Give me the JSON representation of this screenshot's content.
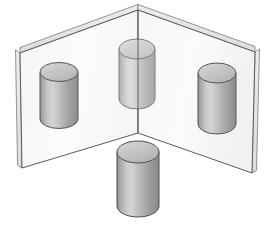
{
  "figure": {
    "canvas": {
      "width": 266,
      "height": 225,
      "background": "#ffffff"
    },
    "palette": {
      "plane_fill": "#fbfbfb",
      "plane_fill_right": "#f7f7f7",
      "plane_edge": "#58585a",
      "plane_thickness_fill": "#e3e3e3",
      "fold_line": "#6a6a6c",
      "cylinder_outline": "#4e4e50",
      "cylinder_top_fill": "#c9c9c9",
      "cylinder_body_dark": "#8d8d8d",
      "cylinder_body_light": "#d2d2d2",
      "cylinder_body_mid": "#a8a8a8"
    },
    "planes": [
      {
        "name": "left-plane",
        "label": "Left vertical plane",
        "points": "138,10 20,53 22,168 138,133",
        "thickness_top": "138,10 20,53 20,48 138,5",
        "thickness_side": "20,53 22,168 18,165 16,50"
      },
      {
        "name": "right-plane",
        "label": "Right vertical plane",
        "points": "138,10 255,52 252,173 138,133",
        "thickness_top": "138,10 255,52 255,47 138,5",
        "thickness_side": "255,52 252,173 256,170 259,49"
      }
    ],
    "fold": {
      "name": "center-fold-line",
      "label": "Corner fold line",
      "x": 138,
      "y_top": 10,
      "y_bottom": 133
    },
    "cylinders": [
      {
        "name": "cylinder-left",
        "label": "Left cylinder",
        "cx": 59,
        "top_cy": 72,
        "bottom_cy": 119,
        "rx": 19,
        "ry": 9.5,
        "opacity": 0.96
      },
      {
        "name": "cylinder-top-center",
        "label": "Top center cylinder (translucent, straddles fold)",
        "cx": 137,
        "top_cy": 49,
        "bottom_cy": 99,
        "rx": 18,
        "ry": 10,
        "opacity": 0.72
      },
      {
        "name": "cylinder-right",
        "label": "Right cylinder",
        "cx": 217,
        "top_cy": 73,
        "bottom_cy": 124,
        "rx": 19,
        "ry": 10,
        "opacity": 0.96
      },
      {
        "name": "cylinder-bottom-front",
        "label": "Bottom front cylinder",
        "cx": 138,
        "top_cy": 152,
        "bottom_cy": 206,
        "rx": 21,
        "ry": 11,
        "opacity": 1
      }
    ]
  }
}
